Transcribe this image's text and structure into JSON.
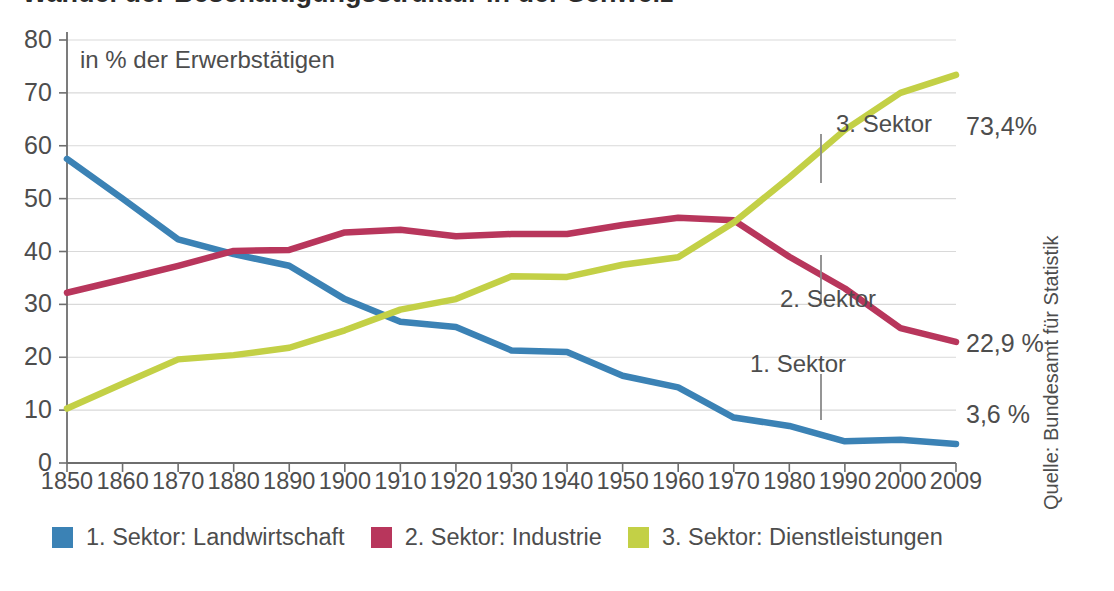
{
  "title": "Wandel der Beschäftigungsstruktur in der Schweiz",
  "subtitle": "in % der Erwerbstätigen",
  "source_note": "Quelle: Bundesamt für Statistik",
  "colors": {
    "sector1": "#3b82b5",
    "sector2": "#b8365c",
    "sector3": "#c3d046",
    "axis": "#6e6e6e",
    "grid": "#d9d9d9",
    "text": "#4d4d4d"
  },
  "annotations": [
    {
      "label": "3. Sektor",
      "x": 836,
      "y": 110,
      "tick_x": 821,
      "tick_y0": 134,
      "tick_y1": 183
    },
    {
      "label": "2. Sektor",
      "x": 780,
      "y": 285,
      "tick_x": 821,
      "tick_y0": 255,
      "tick_y1": 303
    },
    {
      "label": "1. Sektor",
      "x": 750,
      "y": 350,
      "tick_x": 821,
      "tick_y0": 374,
      "tick_y1": 420
    }
  ],
  "end_values": [
    {
      "label": "73,4%",
      "x": 966,
      "y": 112
    },
    {
      "label": "22,9 %",
      "x": 966,
      "y": 329
    },
    {
      "label": "3,6 %",
      "x": 966,
      "y": 400
    }
  ],
  "legend": {
    "items": [
      {
        "label": "1. Sektor: Landwirtschaft",
        "color": "#3b82b5"
      },
      {
        "label": "2. Sektor: Industrie",
        "color": "#b8365c"
      },
      {
        "label": "3. Sektor: Dienstleistungen",
        "color": "#c3d046"
      }
    ]
  },
  "chart_data": {
    "type": "line",
    "title": "Wandel der Beschäftigungsstruktur in der Schweiz",
    "subtitle": "in % der Erwerbstätigen",
    "xlabel": "",
    "ylabel": "in % der Erwerbstätigen",
    "xlim": [
      1850,
      2009
    ],
    "ylim": [
      0,
      80
    ],
    "yticks": [
      0,
      10,
      20,
      30,
      40,
      50,
      60,
      70,
      80
    ],
    "xticks": [
      1850,
      1860,
      1870,
      1880,
      1890,
      1900,
      1910,
      1920,
      1930,
      1940,
      1950,
      1960,
      1970,
      1980,
      1990,
      2000,
      2009
    ],
    "grid": "horizontal",
    "legend_position": "bottom",
    "x": [
      1850,
      1860,
      1870,
      1880,
      1890,
      1900,
      1910,
      1920,
      1930,
      1940,
      1950,
      1960,
      1970,
      1980,
      1990,
      2000,
      2009
    ],
    "series": [
      {
        "name": "1. Sektor: Landwirtschaft",
        "color": "#3b82b5",
        "values": [
          57.5,
          50.0,
          42.3,
          39.5,
          37.3,
          31.0,
          26.7,
          25.7,
          21.3,
          21.0,
          16.5,
          14.3,
          8.6,
          7.0,
          4.1,
          4.4,
          3.6
        ]
      },
      {
        "name": "2. Sektor: Industrie",
        "color": "#b8365c",
        "values": [
          32.2,
          34.7,
          37.3,
          40.1,
          40.3,
          43.6,
          44.1,
          42.9,
          43.3,
          43.3,
          45.0,
          46.4,
          45.9,
          39.0,
          33.0,
          25.5,
          22.9
        ]
      },
      {
        "name": "3. Sektor: Dienstleistungen",
        "color": "#c3d046",
        "values": [
          10.3,
          15.0,
          19.6,
          20.4,
          21.8,
          25.1,
          29.0,
          31.0,
          35.3,
          35.2,
          37.5,
          38.9,
          45.5,
          54.0,
          63.0,
          70.0,
          73.4
        ]
      }
    ]
  },
  "axis": {
    "ylabels": [
      "80",
      "70",
      "60",
      "50",
      "40",
      "30",
      "20",
      "10",
      "0"
    ],
    "xlabels": [
      "1850",
      "1860",
      "1870",
      "1880",
      "1890",
      "1900",
      "1910",
      "1920",
      "1930",
      "1940",
      "1950",
      "1960",
      "1970",
      "1980",
      "1990",
      "2000",
      "2009"
    ]
  }
}
